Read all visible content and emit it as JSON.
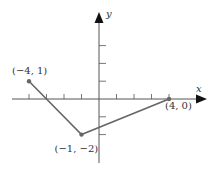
{
  "chart_data": {
    "type": "line",
    "title": "",
    "xlabel": "x",
    "ylabel": "y",
    "xlim": [
      -5,
      5
    ],
    "ylim": [
      -3,
      5
    ],
    "grid": false,
    "x_ticks": [
      -4,
      -3,
      -2,
      -1,
      1,
      2,
      3,
      4
    ],
    "y_ticks": [
      -2,
      -1,
      1,
      2,
      3
    ],
    "series": [
      {
        "name": "polyline",
        "points": [
          {
            "x": -4,
            "y": 1,
            "label": "(−4, 1)"
          },
          {
            "x": -1,
            "y": -2,
            "label": "(−1, −2)"
          },
          {
            "x": 4,
            "y": 0,
            "label": "(4, 0)"
          }
        ]
      }
    ]
  },
  "colors": {
    "axis": "#555555",
    "line": "#666666",
    "point": "#666666",
    "text": "#333333"
  }
}
